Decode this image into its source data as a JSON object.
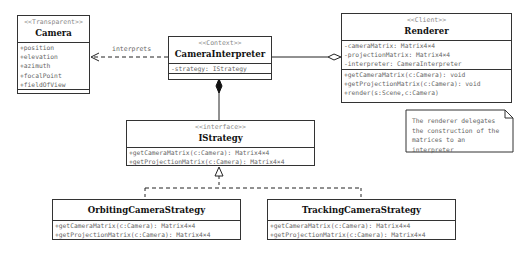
{
  "classes": {
    "camera": {
      "stereotype": "<<Transparent>>",
      "name": "Camera",
      "attributes": [
        "+position",
        "+elevation",
        "+azimuth",
        "+focalPoint",
        "+fieldOfView"
      ],
      "operations": []
    },
    "interpreter": {
      "stereotype": "<<Context>>",
      "name": "CameraInterpreter",
      "attributes": [
        "-strategy: IStrategy"
      ],
      "operations": []
    },
    "renderer": {
      "stereotype": "<<Client>>",
      "name": "Renderer",
      "attributes": [
        "-cameraMatrix: Matrix4×4",
        "-projectionMatrix: Matrix4×4",
        "-interpreter: CameraInterpreter"
      ],
      "operations": [
        "+getCameraMatrix(c:Camera): void",
        "+getProjectionMatrix(c:Camera): void",
        "+render(s:Scene,c:Camera)"
      ]
    },
    "istrategy": {
      "stereotype": "<<interface>>",
      "name": "IStrategy",
      "operations": [
        "+getCameraMatrix(c:Camera): Matrix4×4",
        "+getProjectionMatrix(c:Camera): Matrix4×4"
      ]
    },
    "orbiting": {
      "name": "OrbitingCameraStrategy",
      "operations": [
        "+getCameraMatrix(c:Camera): Matrix4×4",
        "+getProjectionMatrix(c:Camera): Matrix4×4"
      ]
    },
    "tracking": {
      "name": "TrackingCameraStrategy",
      "operations": [
        "+getCameraMatrix(c:Camera): Matrix4×4",
        "+getProjectionMatrix(c:Camera): Matrix4×4"
      ]
    }
  },
  "relations": {
    "interprets_label": "interprets"
  },
  "note": {
    "lines": [
      "The renderer delegates",
      "the construction of the",
      "matrices to an interpreter"
    ]
  }
}
